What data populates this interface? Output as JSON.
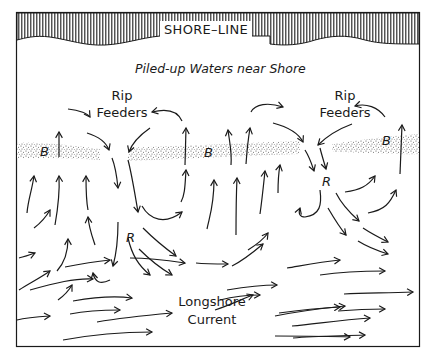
{
  "diagram": {
    "shore_label": "SHORE–LINE",
    "title": "Piled-up Waters near Shore",
    "rip_feeders": [
      {
        "line1": "Rip",
        "line2": "Feeders"
      },
      {
        "line1": "Rip",
        "line2": "Feeders"
      }
    ],
    "bar_markers": [
      "B",
      "B",
      "B"
    ],
    "rip_markers": [
      "R",
      "R"
    ],
    "longshore": {
      "line1": "Longshore",
      "line2": "Current"
    },
    "colors": {
      "ink": "#1a1a1a",
      "background": "#ffffff",
      "stipple": "#555555"
    }
  }
}
